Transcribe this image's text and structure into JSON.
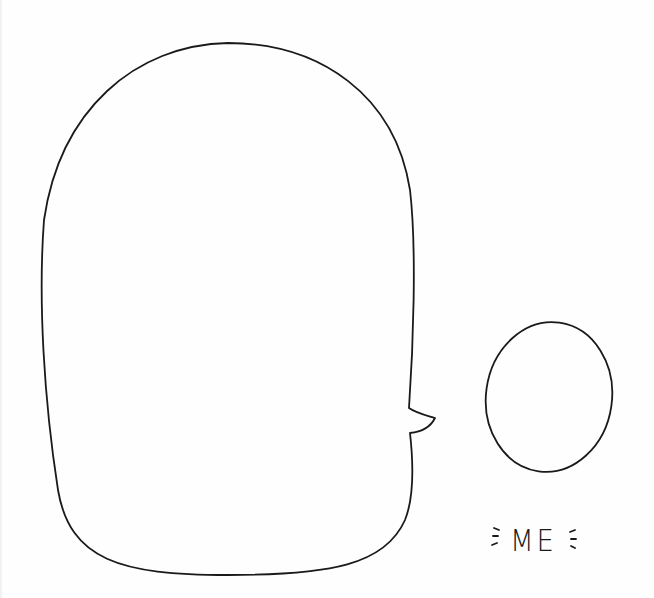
{
  "illustration": {
    "speech_bubble": {
      "text": ""
    },
    "avatar_oval": {
      "label": "ME"
    },
    "stroke_color": "#1a1a1a",
    "background": "#fefefe"
  }
}
